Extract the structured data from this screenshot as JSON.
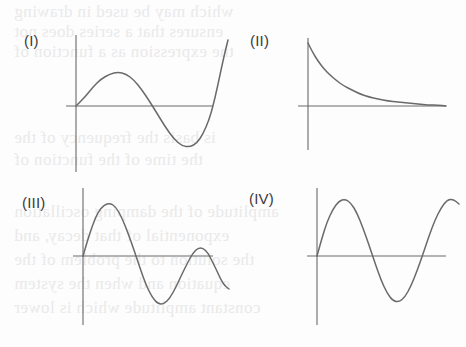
{
  "page": {
    "width": 466,
    "height": 347,
    "background_color": "#fdfdfd",
    "ink_color": "#6a6a6a",
    "label_color": "#3a3a3a",
    "bleed_color": "#e9e9ea"
  },
  "bleed_text": [
    {
      "text": "which may be used in drawing",
      "x": 14,
      "y": 2
    },
    {
      "text": "ensures that a series does not",
      "x": 14,
      "y": 22
    },
    {
      "text": "the expression as a function of",
      "x": 14,
      "y": 42
    },
    {
      "text": "is basis the frequency of the",
      "x": 14,
      "y": 128
    },
    {
      "text": "the time of the function of",
      "x": 14,
      "y": 150
    },
    {
      "text": "amplitude of the damping oscillation",
      "x": 14,
      "y": 202
    },
    {
      "text": "exponential of that decay, and",
      "x": 14,
      "y": 226
    },
    {
      "text": "the solution to the problem of the",
      "x": 14,
      "y": 250
    },
    {
      "text": "equation and when the system",
      "x": 14,
      "y": 274
    },
    {
      "text": "constant amplitude which is lower",
      "x": 14,
      "y": 298
    }
  ],
  "panels": [
    {
      "id": "panel-1",
      "label": "(I)",
      "label_x": 24,
      "label_y": 32,
      "graph_name": "sine-one-period",
      "curve_type": "sinusoid",
      "description": "One full period of a sine wave starting at the origin, rising to a crest, falling to a deeper trough, then rising past the axis.",
      "axis": {
        "x_axis_y": 106,
        "y_axis_x": 76,
        "x_axis_start": 66,
        "x_axis_end": 213,
        "y_axis_top": 35,
        "y_axis_bottom": 172
      },
      "curve_points": "76,106 85,97 93,87 101,79 110,74 118,72 126,74 134,80 142,90 150,102 158,115 166,128 174,139 182,146 190,147 197,143 203,134 209,120 213,106 217,89 221,70 225,52 228,40"
    },
    {
      "id": "panel-2",
      "label": "(II)",
      "label_x": 250,
      "label_y": 32,
      "graph_name": "exponential-decay",
      "curve_type": "exponential decay",
      "description": "A decaying exponential curve beginning high on the y-axis and falling asymptotically toward the x-axis.",
      "axis": {
        "x_axis_y": 106,
        "y_axis_x": 308,
        "x_axis_start": 298,
        "x_axis_end": 446,
        "y_axis_top": 38,
        "y_axis_bottom": 150
      },
      "curve_points": "308,43 313,53 318,61 324,69 330,75 337,81 344,86 352,90 360,94 369,97 378,99 388,101 398,102 408,103 418,104 428,105 438,105 446,106"
    },
    {
      "id": "panel-3",
      "label": "(III)",
      "label_x": 22,
      "label_y": 194,
      "graph_name": "damped-oscillation",
      "curve_type": "damped sinusoid",
      "description": "A damped oscillation: two cycles whose amplitude decreases with increasing x.",
      "axis": {
        "x_axis_y": 256,
        "y_axis_x": 83,
        "x_axis_start": 73,
        "x_axis_end": 213,
        "y_axis_top": 188,
        "y_axis_bottom": 325
      },
      "curve_points": "83,256 88,239 93,224 98,212 104,205 110,203 116,207 122,218 128,233 134,250 140,268 146,285 152,297 158,304 164,304 170,298 176,287 182,274 188,262 193,253 198,248 203,248 208,253 212,261 217,271 221,280 225,286 229,289"
    },
    {
      "id": "panel-4",
      "label": "(IV)",
      "label_x": 249,
      "label_y": 190,
      "graph_name": "undamped-oscillation",
      "curve_type": "constant-amplitude sinusoid",
      "description": "An undamped sinusoid of constant amplitude showing about two and a half cycles.",
      "axis": {
        "x_axis_y": 256,
        "y_axis_x": 317,
        "x_axis_start": 307,
        "x_axis_end": 446,
        "y_axis_top": 188,
        "y_axis_bottom": 325
      },
      "curve_points": "317,256 322,238 327,222 333,209 339,201 345,199 351,203 357,213 363,228 369,245 375,263 381,280 387,293 393,301 399,302 405,297 411,286 417,271 423,254 429,236 435,220 441,208 447,200 453,199 459,204"
    }
  ]
}
